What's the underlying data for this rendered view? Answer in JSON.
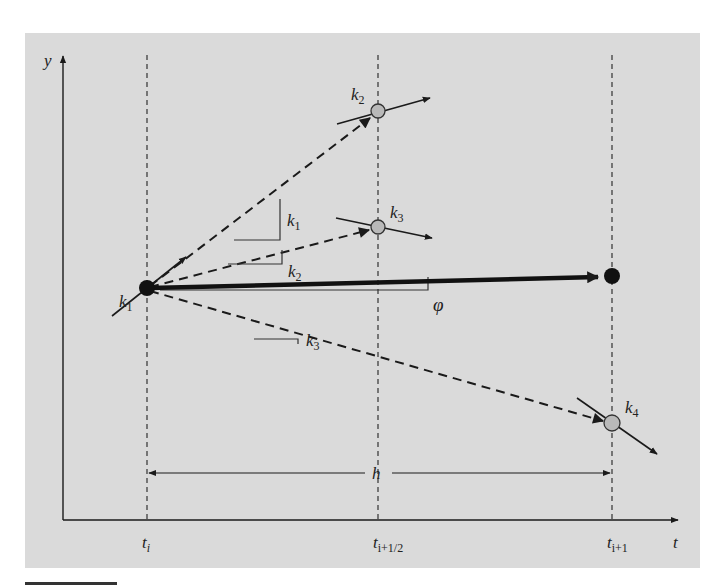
{
  "figure": {
    "type": "diagram",
    "colors": {
      "panel_background": "#dadada",
      "line": "#1a1a1a",
      "open_point_fill": "#b9b9b9",
      "solid_point_fill": "#111111"
    },
    "axes": {
      "x_label": "t",
      "y_label": "y",
      "x_ticks": [
        {
          "main": "t",
          "sub": "i"
        },
        {
          "main": "t",
          "sub": "i+1/2"
        },
        {
          "main": "t",
          "sub": "i+1"
        }
      ]
    },
    "labels": {
      "k1_point": {
        "main": "k",
        "sub": "1"
      },
      "k2_point": {
        "main": "k",
        "sub": "2"
      },
      "k3_point": {
        "main": "k",
        "sub": "3"
      },
      "k4_point": {
        "main": "k",
        "sub": "4"
      },
      "slope_k1": {
        "main": "k",
        "sub": "1"
      },
      "slope_k2": {
        "main": "k",
        "sub": "2"
      },
      "slope_k3": {
        "main": "k",
        "sub": "3"
      },
      "phi": "φ",
      "step": "h"
    }
  }
}
